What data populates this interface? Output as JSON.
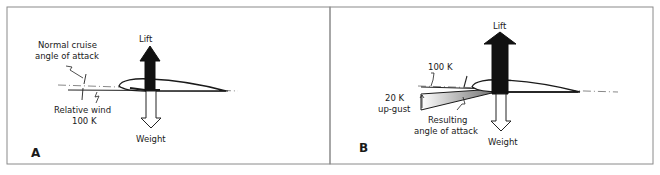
{
  "figure": {
    "panels": [
      {
        "id": "A",
        "letter": "A",
        "labels": {
          "lift": "Lift",
          "weight": "Weight",
          "aoa_line1": "Normal cruise",
          "aoa_line2": "angle of attack",
          "wind_line1": "Relative wind",
          "wind_line2": "100 K"
        }
      },
      {
        "id": "B",
        "letter": "B",
        "labels": {
          "lift": "Lift",
          "weight": "Weight",
          "speed": "100 K",
          "gust_line1": "20 K",
          "gust_line2": "up-gust",
          "aoa_line1": "Resulting",
          "aoa_line2": "angle of attack"
        }
      }
    ],
    "colors": {
      "border": "#8a8a8a",
      "ink": "#1a1a1a",
      "lift_fill": "#111111",
      "weight_fill": "#ffffff",
      "gust_gradient_start": "#ffffff",
      "gust_gradient_end": "#6e6e6e"
    }
  }
}
